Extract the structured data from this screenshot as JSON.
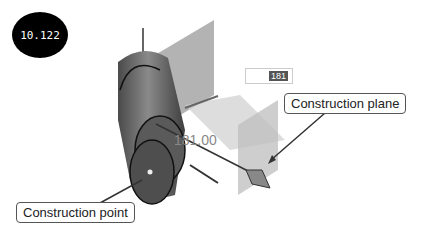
{
  "badge": {
    "label": "10.122"
  },
  "dimension": {
    "input_value": "181",
    "display_value": "181.00"
  },
  "callouts": {
    "plane": "Construction plane",
    "point": "Construction point"
  },
  "colors": {
    "badge_bg": "#000000",
    "cylinder": "#6e6e6e",
    "plane": "#b8b8b8",
    "callout_border": "#555555"
  }
}
